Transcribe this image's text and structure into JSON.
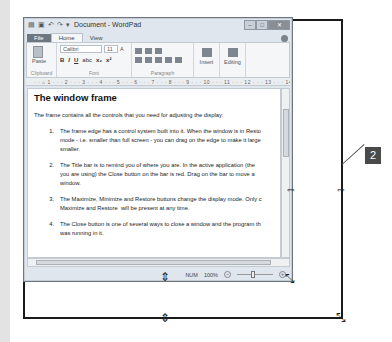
{
  "window": {
    "title": "Document - WordPad",
    "quick_access": [
      "save-icon",
      "undo-icon",
      "redo-icon",
      "dropdown-icon"
    ],
    "controls": {
      "minimize": "–",
      "maximize": "□",
      "close": "✕"
    }
  },
  "ribbon": {
    "tabs": [
      {
        "label": "File"
      },
      {
        "label": "Home"
      },
      {
        "label": "View"
      }
    ],
    "groups": {
      "clipboard": {
        "label": "Clipboard",
        "paste": "Paste"
      },
      "font": {
        "label": "Font",
        "font_name": "Calibri",
        "font_size": "11",
        "buttons": [
          "B",
          "I",
          "U",
          "abc",
          "x₂",
          "x²"
        ]
      },
      "paragraph": {
        "label": "Paragraph"
      },
      "insert": {
        "label": "Insert"
      },
      "editing": {
        "label": "Editing"
      }
    }
  },
  "ruler": {
    "text": "· · ⌂ 1 · · · 2 · · · 3 · · · 4 · · · 5 · · · 6 · · · 7 · · · 8 · · · 9 · · · 10 · · · 11 · · · 12 · · · 13 · · · 14 ·"
  },
  "document": {
    "heading": "The window frame",
    "intro": "The frame contains all the controls that you need for adjusting the display:",
    "items": [
      {
        "num": "1.",
        "text": "The frame edge has a control system built into it. When the window is in Resto\nmode - i.e. smaller than full screen - you can drag on the edge to make it large\nsmaller."
      },
      {
        "num": "2.",
        "text": "The Title bar is to remind you of where you are. In the active application (the \nyou are using) the Close button on the bar is red. Drag on the bar to move a\nwindow."
      },
      {
        "num": "3.",
        "text": "The Maximize, Minimize and Restore buttons change the display mode. Only c\nMaximize and Restore  will be present at any time."
      },
      {
        "num": "4.",
        "text": "The Close button is one of several ways to close a window and the program th\nwas running in it."
      }
    ]
  },
  "statusbar": {
    "num_lock": "NUM",
    "zoom_level": "100%",
    "zoom_out": "−",
    "zoom_in": "+"
  },
  "callout": {
    "label": "2"
  },
  "cursors": {
    "resize_vertical": "⇕",
    "resize_horizontal": "⇔",
    "resize_diagonal": "⤡"
  }
}
